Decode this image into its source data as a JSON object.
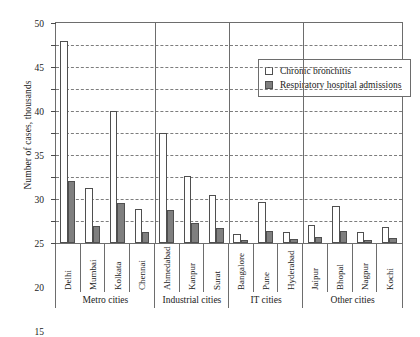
{
  "chart_data": {
    "type": "bar",
    "title": "",
    "xlabel": "",
    "ylabel": "Number of cases, thousands",
    "ylim": [
      0,
      50
    ],
    "ytick_step": 5,
    "yticks": [
      0,
      5,
      10,
      15,
      20,
      25,
      30,
      35,
      40,
      45,
      50
    ],
    "ytick_labels": [
      "0",
      "5",
      "10",
      "15",
      "20",
      "25",
      "30",
      "35",
      "40",
      "45",
      "50"
    ],
    "grid": "horizontal-dashed",
    "legend_position": "top-right-inside",
    "categories": [
      "Delhi",
      "Mumbai",
      "Kolkata",
      "Chennai",
      "Ahmedabad",
      "Kanpur",
      "Surat",
      "Bangalore",
      "Pune",
      "Hyderabad",
      "Jaipur",
      "Bhopal",
      "Nagpur",
      "Kochi"
    ],
    "series": [
      {
        "name": "Chronic bronchitis",
        "color": "#ffffff",
        "values": [
          46,
          12.5,
          30,
          7.8,
          25,
          15.3,
          11,
          2,
          9.3,
          2.5,
          4,
          8.3,
          2.4,
          3.6
        ]
      },
      {
        "name": "Respiratory hospital admissions",
        "color": "#7f7f7f",
        "values": [
          14,
          3.8,
          9,
          2.4,
          7.5,
          4.5,
          3.4,
          0.7,
          2.8,
          0.8,
          1.3,
          2.7,
          0.7,
          1.2
        ]
      }
    ],
    "groups": [
      {
        "label": "Metro cities",
        "span": 4
      },
      {
        "label": "Industrial cities",
        "span": 3
      },
      {
        "label": "IT cities",
        "span": 3
      },
      {
        "label": "Other cities",
        "span": 4
      }
    ]
  }
}
